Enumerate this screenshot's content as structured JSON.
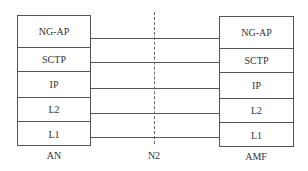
{
  "diagram": {
    "type": "protocol-stack",
    "left_entity": {
      "name": "AN",
      "layers": [
        "NG-AP",
        "SCTP",
        "IP",
        "L2",
        "L1"
      ]
    },
    "right_entity": {
      "name": "AMF",
      "layers": [
        "NG-AP",
        "SCTP",
        "IP",
        "L2",
        "L1"
      ]
    },
    "interface": {
      "name": "N2"
    }
  }
}
